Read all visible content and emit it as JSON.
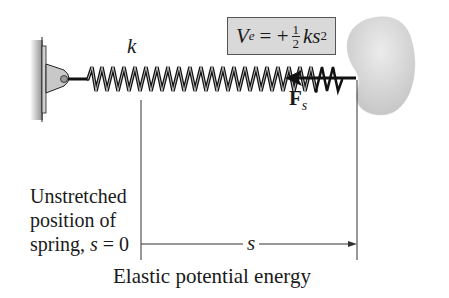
{
  "diagram": {
    "spring_constant_label": "k",
    "formula": {
      "lhs": "V",
      "lhs_subscript": "e",
      "equals_sign": "= +",
      "fraction_numerator": "1",
      "fraction_denominator": "2",
      "rhs": "ks",
      "rhs_exponent": "2",
      "background_color": "#d9d9d9"
    },
    "force_label": {
      "main": "F",
      "subscript": "s"
    },
    "unstretched_label": {
      "line1": "Unstretched",
      "line2": "position of",
      "line3_prefix": "spring, ",
      "line3_var": "s",
      "line3_suffix": " = 0"
    },
    "displacement_label": "s",
    "caption": "Elastic potential energy",
    "colors": {
      "wall": "#9a9a9a",
      "bracket": "#c8c8c8",
      "blob": "#d6d6d6",
      "spring": "#1a1a1a"
    }
  }
}
